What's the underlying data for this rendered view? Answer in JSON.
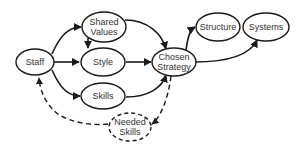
{
  "diagram": {
    "title": "",
    "nodes": [
      {
        "id": "staff",
        "lines": [
          "Staff"
        ],
        "style": "solid"
      },
      {
        "id": "shared_values",
        "lines": [
          "Shared",
          "Values"
        ],
        "style": "solid"
      },
      {
        "id": "style",
        "lines": [
          "Style"
        ],
        "style": "solid"
      },
      {
        "id": "skills",
        "lines": [
          "Skills"
        ],
        "style": "solid"
      },
      {
        "id": "chosen_strategy",
        "lines": [
          "Chosen",
          "Strategy"
        ],
        "style": "solid"
      },
      {
        "id": "structure",
        "lines": [
          "Structure"
        ],
        "style": "solid"
      },
      {
        "id": "systems",
        "lines": [
          "Systems"
        ],
        "style": "solid"
      },
      {
        "id": "needed_skills",
        "lines": [
          "Needed",
          "Skills"
        ],
        "style": "dashed"
      }
    ],
    "edges": [
      {
        "from": "staff",
        "to": "shared_values",
        "style": "solid"
      },
      {
        "from": "staff",
        "to": "style",
        "style": "solid"
      },
      {
        "from": "staff",
        "to": "skills",
        "style": "solid"
      },
      {
        "from": "shared_values",
        "to": "style",
        "style": "solid"
      },
      {
        "from": "shared_values",
        "to": "chosen_strategy",
        "style": "solid"
      },
      {
        "from": "style",
        "to": "chosen_strategy",
        "style": "solid"
      },
      {
        "from": "skills",
        "to": "chosen_strategy",
        "style": "solid"
      },
      {
        "from": "chosen_strategy",
        "to": "structure",
        "style": "solid"
      },
      {
        "from": "chosen_strategy",
        "to": "systems",
        "style": "solid"
      },
      {
        "from": "chosen_strategy",
        "to": "needed_skills",
        "style": "dashed"
      },
      {
        "from": "needed_skills",
        "to": "staff",
        "style": "dashed"
      }
    ],
    "colors": {
      "stroke": "#1a1a1a",
      "text": "#333333",
      "background": "#ffffff"
    }
  }
}
